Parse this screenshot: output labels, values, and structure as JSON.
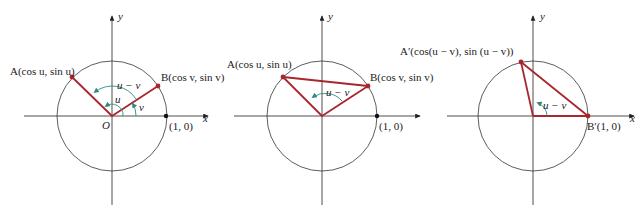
{
  "colors": {
    "segment": "#a8262e",
    "point": "#a8262e",
    "angle_arrow": "#2a8c7e",
    "axis": "#222222",
    "circle": "#333333"
  },
  "panels": [
    {
      "id": "panel-1",
      "axis_x_label": "x",
      "axis_y_label": "y",
      "origin_label": "O",
      "unit_point_label": "(1, 0)",
      "point_a_label": "A(cos u, sin u)",
      "point_b_label": "B(cos v, sin v)",
      "angle_u_label": "u",
      "angle_v_label": "v",
      "angle_diff_label": "u − v"
    },
    {
      "id": "panel-2",
      "axis_x_label": "x",
      "axis_y_label": "y",
      "unit_point_label": "(1, 0)",
      "point_a_label": "A(cos u, sin u)",
      "point_b_label": "B(cos v, sin v)",
      "angle_diff_label": "u − v"
    },
    {
      "id": "panel-3",
      "axis_x_label": "x",
      "axis_y_label": "y",
      "point_a_label": "A′(cos(u − v), sin (u − v))",
      "point_b_label": "B′(1, 0)",
      "angle_diff_label": "u − v"
    }
  ]
}
